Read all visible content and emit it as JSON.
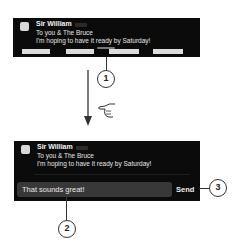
{
  "notification_before": {
    "sender": "Sir William",
    "line1": "To you & The Bruce",
    "line2": "I'm hoping to have it ready by Saturday!",
    "app_icon": "messages-app-icon"
  },
  "gesture": {
    "arrow_direction": "down",
    "hand_icon": "hand-pointing-icon"
  },
  "notification_after": {
    "sender": "Sir William",
    "line1": "To you & The Bruce",
    "line2": "I'm hoping to have it ready by Saturday!",
    "reply_value": "That sounds great!",
    "send_label": "Send"
  },
  "callouts": [
    "1",
    "2",
    "3"
  ],
  "colors": {
    "banner_bg": "#0b0b0b",
    "input_bg": "#383838",
    "callout_stroke": "#333333"
  }
}
